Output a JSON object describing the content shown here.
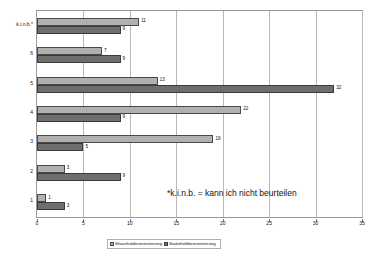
{
  "chart_data": {
    "type": "bar",
    "orientation": "horizontal",
    "title": "",
    "xlabel": "",
    "ylabel": "",
    "xlim": [
      0,
      35
    ],
    "xticks": [
      0,
      5,
      10,
      15,
      20,
      25,
      30,
      35
    ],
    "grid": true,
    "grid_axis": "x",
    "legend_position": "bottom",
    "categories": [
      "1",
      "2",
      "3",
      "4",
      "5",
      "6",
      "k.i.n.b.*"
    ],
    "series": [
      {
        "name": "Shareholderorientierung",
        "color": "#b0b0b0",
        "values": [
          1,
          3,
          19,
          22,
          13,
          7,
          11
        ]
      },
      {
        "name": "Stakeholderorientierung",
        "color": "#6e6e6e",
        "values": [
          3,
          9,
          5,
          9,
          32,
          9,
          9
        ]
      }
    ],
    "annotations": [
      {
        "text": "*k.i.n.b. = kann ich nicht beurteilen",
        "x": 16.5,
        "y": 1.6
      }
    ]
  }
}
